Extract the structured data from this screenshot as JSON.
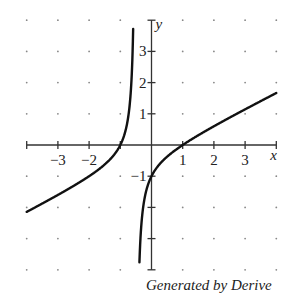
{
  "chart_data": {
    "type": "line",
    "title": "",
    "xlabel": "x",
    "ylabel": "y",
    "xlim": [
      -4,
      4
    ],
    "ylim": [
      -4,
      4
    ],
    "grid": "dots",
    "x_ticks": [
      -4,
      -3,
      -2,
      -1,
      1,
      2,
      3,
      4
    ],
    "x_tick_labels": [
      "−3",
      "−2",
      "1",
      "2",
      "3"
    ],
    "x_tick_label_values": [
      -3,
      -2,
      1,
      2,
      3
    ],
    "y_ticks": [
      -4,
      -3,
      -2,
      -1,
      1,
      2,
      3,
      4
    ],
    "y_tick_labels": [
      "3",
      "2",
      "1",
      "−1"
    ],
    "y_tick_label_values": [
      3,
      2,
      1,
      -1
    ],
    "series": [
      {
        "name": "f(x)",
        "description": "Rational function with vertical asymptote near x = -0.5, zeros at x = -1 and x = 1, y-intercept -1",
        "x": [
          -4,
          -3,
          -2,
          -1.5,
          -1,
          -0.8,
          -0.65,
          -0.58,
          -0.55
        ],
        "y": [
          -2.14,
          -1.6,
          -1.0,
          -0.63,
          0,
          0.6,
          1.93,
          3.6,
          4.0
        ]
      },
      {
        "name": "f(x) right branch",
        "x": [
          -0.42,
          -0.35,
          -0.2,
          0,
          0.5,
          1,
          2,
          3,
          4
        ],
        "y": [
          -4.0,
          -2.92,
          -1.6,
          -1,
          -0.38,
          0,
          0.6,
          1.14,
          1.67
        ]
      }
    ],
    "annotations": [
      "Generated by Derive"
    ]
  },
  "footer": {
    "credit": "Generated by Derive"
  },
  "labels": {
    "x_axis": "x",
    "y_axis": "y"
  }
}
